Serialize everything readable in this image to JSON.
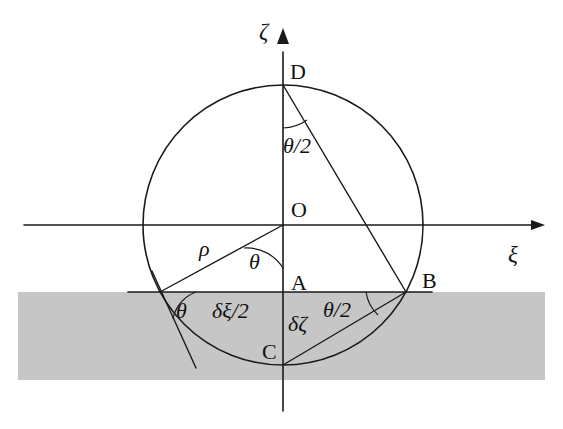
{
  "figure": {
    "type": "geometry-diagram",
    "background_color": "#ffffff",
    "line_color": "#1a1a1a",
    "substrate_color": "#c6c6c6"
  },
  "axes": {
    "vertical_label": "ζ",
    "horizontal_label": "ξ"
  },
  "points": {
    "origin": "O",
    "top": "D",
    "bottom": "C",
    "chord_mid": "A",
    "chord_right": "B"
  },
  "annotations": {
    "radius": "ρ",
    "angle_origin": "θ",
    "angle_left_contact": "θ",
    "angle_top_half": "θ/2",
    "angle_right_half": "θ/2",
    "half_width": "δξ/2",
    "height": "δζ"
  },
  "geometry": {
    "circle_center_x": 283,
    "circle_center_y": 225,
    "circle_radius": 140,
    "substrate_top_y": 292,
    "substrate_bottom_y": 380,
    "chord_left_x": 160,
    "chord_right_x": 406
  }
}
